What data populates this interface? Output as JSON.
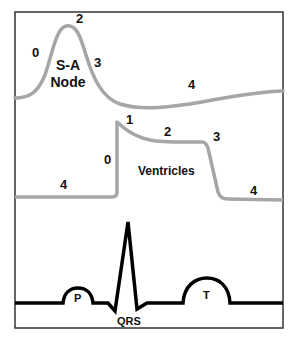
{
  "colors": {
    "frame": "#333333",
    "action_potential_curve": "#a6a6a6",
    "ecg_trace": "#000000",
    "text": "#111111",
    "background": "#ffffff"
  },
  "panels": {
    "sa_node": {
      "title_line1": "S-A",
      "title_line2": "Node",
      "phase_labels": {
        "p0": "0",
        "p2": "2",
        "p3": "3",
        "p4": "4"
      }
    },
    "ventricles": {
      "title": "Ventricles",
      "phase_labels": {
        "p0": "0",
        "p1": "1",
        "p2": "2",
        "p3": "3",
        "p4_left": "4",
        "p4_right": "4"
      }
    },
    "ecg": {
      "wave_labels": {
        "p": "P",
        "qrs": "QRS",
        "t": "T"
      }
    }
  }
}
